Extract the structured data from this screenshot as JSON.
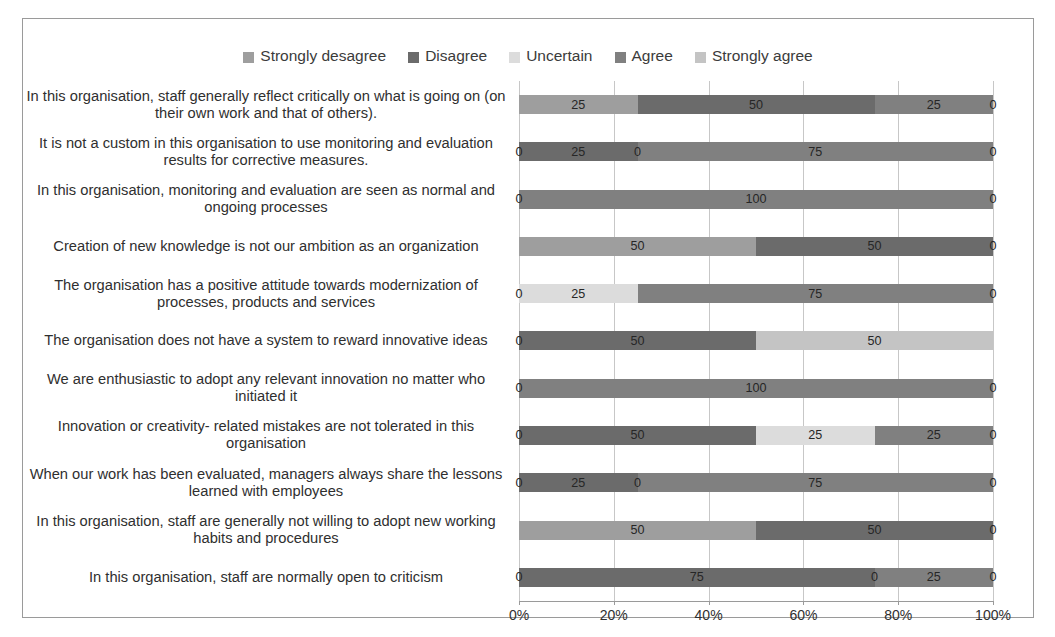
{
  "chart_data": {
    "type": "bar",
    "subtype": "stacked-horizontal-100pct",
    "title": "",
    "xlabel": "",
    "ylabel": "",
    "xlim": [
      0,
      100
    ],
    "xtick_labels": [
      "0%",
      "20%",
      "40%",
      "60%",
      "80%",
      "100%"
    ],
    "xtick_values": [
      0,
      20,
      40,
      60,
      80,
      100
    ],
    "grid": true,
    "legend_position": "top-center",
    "colors": {
      "strongly_desagree": "#9e9e9e",
      "disagree": "#6b6b6b",
      "uncertain": "#dcdcdc",
      "agree": "#808080",
      "strongly_agree": "#c4c4c4"
    },
    "legend": [
      "Strongly desagree",
      "Disagree",
      "Uncertain",
      "Agree",
      "Strongly agree"
    ],
    "categories": [
      "In this organisation, staff generally reflect critically on what is going on (on their own work and that of others).",
      "It is not a custom in this organisation to use monitoring and evaluation results for corrective measures.",
      "In this organisation, monitoring and evaluation are seen as normal and ongoing processes",
      "Creation of new knowledge is not our ambition as an organization",
      "The organisation has a positive attitude towards modernization of processes, products and services",
      "The organisation does not have a system to reward innovative ideas",
      "We are enthusiastic to adopt any relevant innovation no matter who initiated it",
      "Innovation or creativity- related mistakes are not tolerated in this organisation",
      "When our work has been evaluated, managers always share the lessons learned with employees",
      "In this organisation, staff are generally not willing to adopt new working habits and procedures",
      "In this organisation, staff are normally open to criticism"
    ],
    "series": [
      {
        "name": "Strongly desagree",
        "color": "#9e9e9e",
        "values": [
          25,
          0,
          0,
          50,
          0,
          0,
          0,
          0,
          0,
          50,
          0
        ]
      },
      {
        "name": "Disagree",
        "color": "#6b6b6b",
        "values": [
          50,
          25,
          0,
          50,
          25,
          50,
          0,
          50,
          25,
          50,
          75
        ]
      },
      {
        "name": "Uncertain",
        "color": "#dcdcdc",
        "values": [
          0,
          0,
          0,
          0,
          0,
          0,
          0,
          25,
          0,
          0,
          0
        ]
      },
      {
        "name": "Agree",
        "color": "#808080",
        "values": [
          25,
          75,
          100,
          0,
          75,
          0,
          100,
          25,
          75,
          0,
          25
        ]
      },
      {
        "name": "Strongly agree",
        "color": "#c4c4c4",
        "values": [
          0,
          0,
          0,
          0,
          0,
          50,
          0,
          0,
          0,
          0,
          0
        ]
      }
    ],
    "rows": [
      {
        "label": "In this organisation, staff generally reflect critically on what is going on (on their own work and that of others).",
        "segments": [
          {
            "series": "Strongly desagree",
            "value": 25,
            "label": "25",
            "color": "#9e9e9e"
          },
          {
            "series": "Disagree",
            "value": 50,
            "label": "50",
            "color": "#6b6b6b"
          },
          {
            "series": "Uncertain",
            "value": 0,
            "label": "",
            "color": "#dcdcdc"
          },
          {
            "series": "Agree",
            "value": 25,
            "label": "25",
            "color": "#808080"
          },
          {
            "series": "Strongly agree",
            "value": 0,
            "label": "0",
            "color": "#c4c4c4"
          }
        ]
      },
      {
        "label": "It is not a custom in this organisation to use monitoring and evaluation results for corrective measures.",
        "segments": [
          {
            "series": "Strongly desagree",
            "value": 0,
            "label": "0",
            "color": "#9e9e9e"
          },
          {
            "series": "Disagree",
            "value": 25,
            "label": "25",
            "color": "#6b6b6b"
          },
          {
            "series": "Uncertain",
            "value": 0,
            "label": "0",
            "color": "#dcdcdc"
          },
          {
            "series": "Agree",
            "value": 75,
            "label": "75",
            "color": "#808080"
          },
          {
            "series": "Strongly agree",
            "value": 0,
            "label": "0",
            "color": "#c4c4c4"
          }
        ]
      },
      {
        "label": "In this organisation, monitoring and evaluation are seen as normal and ongoing processes",
        "segments": [
          {
            "series": "Strongly desagree",
            "value": 0,
            "label": "0",
            "color": "#9e9e9e"
          },
          {
            "series": "Disagree",
            "value": 0,
            "label": "",
            "color": "#6b6b6b"
          },
          {
            "series": "Uncertain",
            "value": 0,
            "label": "",
            "color": "#dcdcdc"
          },
          {
            "series": "Agree",
            "value": 100,
            "label": "100",
            "color": "#808080"
          },
          {
            "series": "Strongly agree",
            "value": 0,
            "label": "0",
            "color": "#c4c4c4"
          }
        ]
      },
      {
        "label": "Creation of new knowledge is not our ambition as an organization",
        "segments": [
          {
            "series": "Strongly desagree",
            "value": 50,
            "label": "50",
            "color": "#9e9e9e"
          },
          {
            "series": "Disagree",
            "value": 50,
            "label": "50",
            "color": "#6b6b6b"
          },
          {
            "series": "Uncertain",
            "value": 0,
            "label": "",
            "color": "#dcdcdc"
          },
          {
            "series": "Agree",
            "value": 0,
            "label": "",
            "color": "#808080"
          },
          {
            "series": "Strongly agree",
            "value": 0,
            "label": "0",
            "color": "#c4c4c4"
          }
        ]
      },
      {
        "label": "The organisation has a positive attitude towards modernization of processes, products and services",
        "segments": [
          {
            "series": "Strongly desagree",
            "value": 0,
            "label": "0",
            "color": "#9e9e9e"
          },
          {
            "series": "Uncertain",
            "value": 25,
            "label": "25",
            "color": "#dcdcdc"
          },
          {
            "series": "Agree",
            "value": 75,
            "label": "75",
            "color": "#808080"
          },
          {
            "series": "Strongly agree",
            "value": 0,
            "label": "0",
            "color": "#c4c4c4"
          }
        ]
      },
      {
        "label": "The organisation does not have a system to reward innovative ideas",
        "segments": [
          {
            "series": "Strongly desagree",
            "value": 0,
            "label": "0",
            "color": "#9e9e9e"
          },
          {
            "series": "Disagree",
            "value": 50,
            "label": "50",
            "color": "#6b6b6b"
          },
          {
            "series": "Strongly agree",
            "value": 50,
            "label": "50",
            "color": "#c4c4c4"
          }
        ]
      },
      {
        "label": "We are enthusiastic to adopt any relevant innovation no matter who initiated it",
        "segments": [
          {
            "series": "Strongly desagree",
            "value": 0,
            "label": "0",
            "color": "#9e9e9e"
          },
          {
            "series": "Agree",
            "value": 100,
            "label": "100",
            "color": "#808080"
          },
          {
            "series": "Strongly agree",
            "value": 0,
            "label": "0",
            "color": "#c4c4c4"
          }
        ]
      },
      {
        "label": "Innovation or creativity- related mistakes are not tolerated in this organisation",
        "segments": [
          {
            "series": "Strongly desagree",
            "value": 0,
            "label": "0",
            "color": "#9e9e9e"
          },
          {
            "series": "Disagree",
            "value": 50,
            "label": "50",
            "color": "#6b6b6b"
          },
          {
            "series": "Uncertain",
            "value": 25,
            "label": "25",
            "color": "#dcdcdc"
          },
          {
            "series": "Agree",
            "value": 25,
            "label": "25",
            "color": "#808080"
          },
          {
            "series": "Strongly agree",
            "value": 0,
            "label": "0",
            "color": "#c4c4c4"
          }
        ]
      },
      {
        "label": "When our work has been evaluated, managers always share the lessons learned with employees",
        "segments": [
          {
            "series": "Strongly desagree",
            "value": 0,
            "label": "0",
            "color": "#9e9e9e"
          },
          {
            "series": "Disagree",
            "value": 25,
            "label": "25",
            "color": "#6b6b6b"
          },
          {
            "series": "Uncertain",
            "value": 0,
            "label": "0",
            "color": "#dcdcdc"
          },
          {
            "series": "Agree",
            "value": 75,
            "label": "75",
            "color": "#808080"
          },
          {
            "series": "Strongly agree",
            "value": 0,
            "label": "0",
            "color": "#c4c4c4"
          }
        ]
      },
      {
        "label": "In this organisation, staff are generally not willing to adopt new working habits and procedures",
        "segments": [
          {
            "series": "Strongly desagree",
            "value": 50,
            "label": "50",
            "color": "#9e9e9e"
          },
          {
            "series": "Disagree",
            "value": 50,
            "label": "50",
            "color": "#6b6b6b"
          },
          {
            "series": "Strongly agree",
            "value": 0,
            "label": "0",
            "color": "#c4c4c4"
          }
        ]
      },
      {
        "label": "In this organisation, staff are normally open to criticism",
        "segments": [
          {
            "series": "Strongly desagree",
            "value": 0,
            "label": "0",
            "color": "#9e9e9e"
          },
          {
            "series": "Disagree",
            "value": 75,
            "label": "75",
            "color": "#6b6b6b"
          },
          {
            "series": "Uncertain",
            "value": 0,
            "label": "0",
            "color": "#dcdcdc"
          },
          {
            "series": "Agree",
            "value": 25,
            "label": "25",
            "color": "#808080"
          },
          {
            "series": "Strongly agree",
            "value": 0,
            "label": "0",
            "color": "#c4c4c4"
          }
        ]
      }
    ]
  }
}
